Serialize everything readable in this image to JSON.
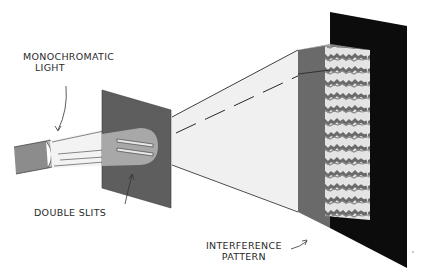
{
  "diagram": {
    "type": "double-slit experiment illustration",
    "labels": {
      "light_line1": "MONOCHROMATIC",
      "light_line2": "LIGHT",
      "slits": "DOUBLE SLITS",
      "pattern_line1": "INTERFERENCE",
      "pattern_line2": "PATTERN"
    },
    "colors": {
      "background": "#ffffff",
      "slit_panel": "#5e5e5e",
      "slit_glow": "#a8a8a8",
      "screen": "#0c0c0c",
      "screen_shadow": "#6a6a6a",
      "pattern_light": "#e2e2e2",
      "pattern_dark": "#6e6e6e",
      "beam": "#f1f1f1",
      "lamp": "#8a8a8a",
      "line": "#2a2a2a"
    }
  }
}
